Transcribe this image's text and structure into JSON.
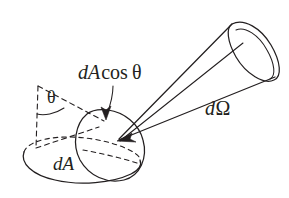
{
  "figure": {
    "background_color": "#ffffff",
    "ink_color": "#231f20",
    "labels": {
      "projected_area": {
        "italic_part": "dA",
        "upright_part": "cos",
        "symbol_part": "θ",
        "full_text": "dA cos θ",
        "x": 78,
        "y": 79,
        "font_size": 20
      },
      "solid_angle": {
        "italic_part": "d",
        "symbol_part": "Ω",
        "full_text": "dΩ",
        "x": 205,
        "y": 115,
        "font_size": 20
      },
      "area_element": {
        "italic_part": "dA",
        "full_text": "dA",
        "x": 53,
        "y": 170,
        "font_size": 19
      },
      "angle_theta": {
        "symbol_part": "θ",
        "full_text": "θ",
        "x": 47,
        "y": 103,
        "font_size": 18
      }
    },
    "shapes": {
      "base_ellipse_dA": {
        "name": "base-area-ellipse",
        "center_x": 81,
        "center_y": 159,
        "rx": 59,
        "ry": 20,
        "rotation_deg": 4
      },
      "tilted_ellipse_projection": {
        "name": "projected-area-ellipse",
        "center_x": 116,
        "center_y": 140,
        "rx": 48,
        "ry": 28,
        "rotation_deg": -65
      },
      "cone_mouth_ellipse": {
        "name": "cone-aperture-ellipse",
        "center_x": 252,
        "center_y": 50,
        "rx": 30,
        "ry": 16,
        "rotation_deg": 68
      },
      "cone_apex": {
        "x": 118,
        "y": 140
      },
      "normal_dashed_line": {
        "x1": 38,
        "y1": 86,
        "x2": 37,
        "y2": 147
      },
      "ray_dashed_line": {
        "x1": 38,
        "y1": 86,
        "x2": 104,
        "y2": 120
      },
      "base_dashed_line": {
        "x1": 37,
        "y1": 147,
        "x2": 98,
        "y2": 127
      },
      "theta_arc": {
        "cx": 38,
        "cy": 86,
        "radius": 28
      }
    }
  }
}
